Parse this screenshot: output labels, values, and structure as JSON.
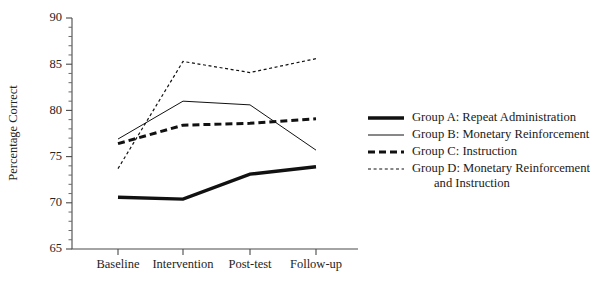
{
  "chart_data": {
    "type": "line",
    "title": "",
    "xlabel": "",
    "ylabel": "Percentage Correct",
    "categories": [
      "Baseline",
      "Intervention",
      "Post-test",
      "Follow-up"
    ],
    "ylim": [
      65,
      90
    ],
    "ytick_labels": [
      "65",
      "70",
      "75",
      "80",
      "85",
      "90"
    ],
    "ytick_values": [
      65,
      70,
      75,
      80,
      85,
      90
    ],
    "yminor_step": 1,
    "grid": false,
    "legend_position": "right",
    "series": [
      {
        "name": "Group A: Repeat Administration",
        "style": "thick-solid",
        "values": [
          70.6,
          70.4,
          73.1,
          73.9
        ]
      },
      {
        "name": "Group B: Monetary Reinforcement",
        "style": "thin-solid",
        "values": [
          76.9,
          81.0,
          80.6,
          75.7
        ]
      },
      {
        "name": "Group C: Instruction",
        "style": "thick-dashed",
        "values": [
          76.4,
          78.4,
          78.6,
          79.1
        ]
      },
      {
        "name": "Group D: Monetary Reinforcement and Instruction",
        "style": "thin-dotted",
        "values": [
          73.7,
          85.3,
          84.1,
          85.6
        ]
      }
    ]
  },
  "legend": {
    "entries": [
      {
        "label": "Group A: Repeat Administration",
        "label2": ""
      },
      {
        "label": "Group B: Monetary Reinforcement",
        "label2": ""
      },
      {
        "label": "Group C: Instruction",
        "label2": ""
      },
      {
        "label": "Group D: Monetary Reinforcement",
        "label2": "and Instruction"
      }
    ]
  },
  "axis": {
    "y_title": "Percentage Correct"
  },
  "colors": {
    "line": "#111111",
    "axis": "#4a4a4a",
    "text": "#1a1a1a",
    "background": "#ffffff"
  }
}
